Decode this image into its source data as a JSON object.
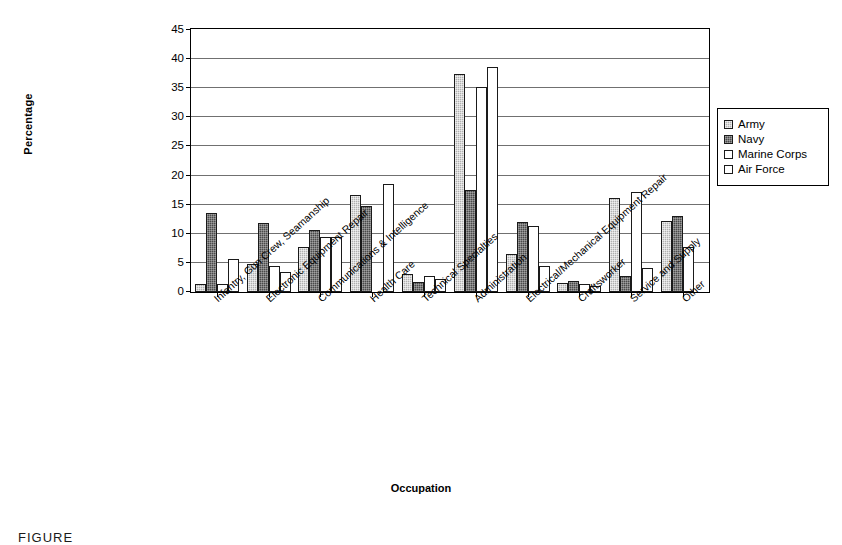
{
  "chart_data": {
    "type": "bar",
    "title": "",
    "xlabel": "Occupation",
    "ylabel": "Percentage",
    "ylim": [
      0,
      45
    ],
    "ytick_step": 5,
    "yticks": [
      0,
      5,
      10,
      15,
      20,
      25,
      30,
      35,
      40,
      45
    ],
    "grid": true,
    "legend_position": "right",
    "categories": [
      "Infantry, Gun Crew, Seamanship",
      "Electronic Equipment Repair",
      "Communications & Intelligence",
      "Health Care",
      "Technical Specialties",
      "Administration",
      "Electrical/Mechanical Equipment Repair",
      "Craftsworker",
      "Service and Supply",
      "Other"
    ],
    "series": [
      {
        "name": "Army",
        "fill": "light-gray-stipple",
        "values": [
          1.3,
          4.8,
          7.8,
          16.7,
          3.1,
          37.5,
          6.6,
          1.5,
          16.2,
          12.2
        ]
      },
      {
        "name": "Navy",
        "fill": "dark-gray-dense",
        "values": [
          13.5,
          11.8,
          10.7,
          14.8,
          1.8,
          17.5,
          12.0,
          1.9,
          2.8,
          13.0
        ]
      },
      {
        "name": "Marine Corps",
        "fill": "white",
        "values": [
          1.3,
          4.5,
          9.4,
          0.0,
          2.7,
          35.2,
          11.3,
          1.3,
          17.2,
          7.7
        ]
      },
      {
        "name": "Air Force",
        "fill": "white",
        "values": [
          5.6,
          3.4,
          9.4,
          18.6,
          2.3,
          38.7,
          4.4,
          1.1,
          4.2,
          0.0
        ]
      }
    ]
  },
  "axis": {
    "y_title": "Percentage",
    "x_title": "Occupation"
  },
  "legend": {
    "items": [
      {
        "label": "Army",
        "swatch": "light-gray-stipple"
      },
      {
        "label": "Navy",
        "swatch": "dark-gray-dense"
      },
      {
        "label": "Marine Corps",
        "swatch": "white"
      },
      {
        "label": "Air Force",
        "swatch": "white"
      }
    ]
  },
  "caption": {
    "text": "FIGURE"
  }
}
